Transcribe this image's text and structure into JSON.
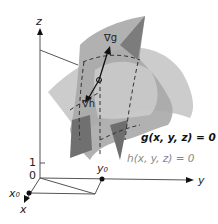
{
  "figure": {
    "axes": {
      "x_label": "x",
      "y_label": "y",
      "z_label": "z",
      "origin_label": "0",
      "tick_z_label": "1"
    },
    "points": {
      "x0_label": "x₀",
      "y0_label": "y₀"
    },
    "vectors": {
      "grad_g_label": "∇g",
      "grad_h_label": "∇h"
    },
    "surfaces": [
      {
        "name": "g",
        "equation": "g(x, y, z) = 0",
        "color": "#111111"
      },
      {
        "name": "h",
        "equation": "h(x, y, z) = 0",
        "color": "#888888"
      }
    ],
    "colors": {
      "axis": "#555555",
      "surface_dark": "#8a8a8a",
      "surface_mid": "#b5b5b5",
      "surface_light": "#d2d2d2",
      "background": "#ffffff"
    }
  }
}
